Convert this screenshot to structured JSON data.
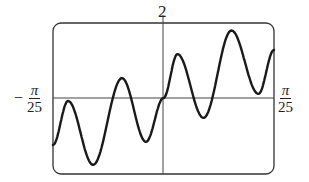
{
  "chart_data": {
    "type": "line",
    "title": "",
    "xlabel": "",
    "ylabel": "",
    "xlim_labels": [
      "-π/25",
      "π/25"
    ],
    "ylim_labels": [
      "",
      "2"
    ],
    "xlim": [
      -0.12566,
      0.12566
    ],
    "ylim": [
      -2,
      2
    ],
    "grid": false,
    "legend": null,
    "axes_frame": "rounded rectangle viewing window",
    "points": [
      {
        "x": -0.12566,
        "y": -1.25
      },
      {
        "x": -0.1085,
        "y": -0.08
      },
      {
        "x": -0.0801,
        "y": -1.78
      },
      {
        "x": -0.0472,
        "y": 0.53
      },
      {
        "x": -0.0199,
        "y": -1.17
      },
      {
        "x": 0.0,
        "y": 0.0
      },
      {
        "x": 0.0159,
        "y": 1.17
      },
      {
        "x": 0.0455,
        "y": -0.53
      },
      {
        "x": 0.0773,
        "y": 1.8
      },
      {
        "x": 0.108,
        "y": 0.11
      },
      {
        "x": 0.12566,
        "y": 1.28
      }
    ]
  },
  "labels": {
    "y_top": "2",
    "x_left_num": "π",
    "x_left_den": "25",
    "x_left_sign": "−",
    "x_right_num": "π",
    "x_right_den": "25"
  },
  "style": {
    "line_color": "#1a1a1a",
    "frame_color": "#333333",
    "axis_color": "#444444"
  }
}
